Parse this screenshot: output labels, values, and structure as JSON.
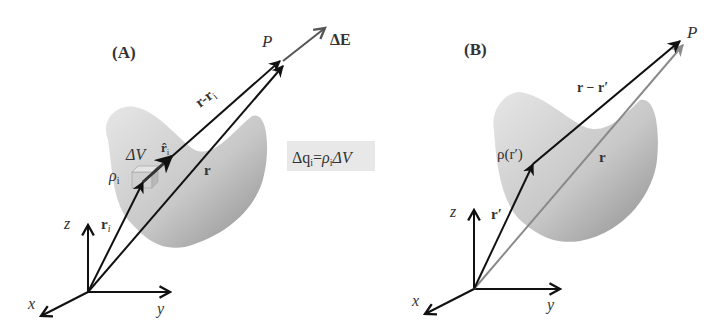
{
  "panels": [
    {
      "id": "A",
      "label": "(A)",
      "point_label": "P",
      "field_label": "ΔE",
      "vectors": {
        "r_minus_ri": "r-r",
        "r_minus_ri_sub": "i",
        "r": "r",
        "ri": "r",
        "ri_sub": "i",
        "unit_ri": "r̂",
        "unit_ri_sub": "i"
      },
      "volume_element": "ΔV",
      "density": "ρ",
      "density_sub": "i",
      "equation": {
        "lhs": "Δq",
        "lhs_sub": "i",
        "eq": "=",
        "rho": "ρ",
        "rho_sub": "i",
        "dv": "ΔV"
      },
      "axes": {
        "x": "x",
        "y": "y",
        "z": "z"
      }
    },
    {
      "id": "B",
      "label": "(B)",
      "point_label": "P",
      "vectors": {
        "r_minus_rprime": "r − r′",
        "r": "r",
        "rprime": "r′"
      },
      "density": "ρ(r′)",
      "axes": {
        "x": "x",
        "y": "y",
        "z": "z"
      }
    }
  ],
  "colors": {
    "vector_dark": "#111111",
    "vector_gray": "#8a8a8a",
    "field_arrow": "#555555",
    "blob_light": "#e2e2e2",
    "blob_dark": "#9c9c9c",
    "equation_bg": "#e8e8e8"
  }
}
